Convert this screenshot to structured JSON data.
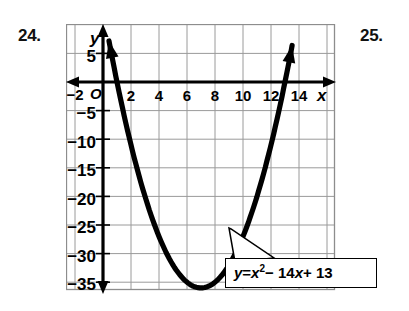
{
  "exercises": {
    "left_number": "24.",
    "right_number": "25."
  },
  "figure": {
    "callout_equation_plain": "y = x2 - 14x + 13",
    "callout_parts": {
      "y": "y",
      "equals": "=",
      "x": "x",
      "exponent": "2",
      "minus": "− 14",
      "x2": "x",
      "plus": "+ 13"
    },
    "x_axis_label": "x",
    "y_axis_label": "y",
    "origin_label": "O"
  },
  "chart_data": {
    "type": "line",
    "title": "",
    "subtitle": "",
    "xlabel": "x",
    "ylabel": "y",
    "equation": "y = x^2 - 14x + 13",
    "curve_kind": "parabola",
    "vertex": [
      7,
      -36
    ],
    "x_intercepts": [
      1,
      13
    ],
    "y_intercept": 13,
    "xlim": [
      -3,
      16
    ],
    "ylim": [
      -38,
      8
    ],
    "grid": true,
    "grid_step_x": 2,
    "grid_step_y": 5,
    "legend": "none",
    "annotations": [
      {
        "text": "y = x² − 14x + 13",
        "points_to": [
          11.5,
          -27
        ]
      }
    ],
    "xticks": [
      -2,
      2,
      4,
      6,
      8,
      10,
      12,
      14
    ],
    "xtick_labels": [
      "−2",
      "2",
      "4",
      "6",
      "8",
      "10",
      "12",
      "14"
    ],
    "yticks": [
      5,
      -5,
      -10,
      -15,
      -20,
      -25,
      -30,
      -35
    ],
    "ytick_labels": [
      "5",
      "−5",
      "−10",
      "−15",
      "−20",
      "−25",
      "−30",
      "−35"
    ],
    "series": [
      {
        "name": "y = x^2 - 14x + 13",
        "x": [
          -1.2,
          -1.0,
          -0.5,
          0,
          0.5,
          1,
          1.5,
          2,
          2.5,
          3,
          3.5,
          4,
          4.5,
          5,
          5.5,
          6,
          6.5,
          7,
          7.5,
          8,
          8.5,
          9,
          9.5,
          10,
          10.5,
          11,
          11.5,
          12,
          12.5,
          13,
          13.5,
          14,
          14.5,
          15,
          15.2
        ],
        "y": [
          31.2,
          28,
          20.25,
          13,
          6.25,
          0,
          -5.75,
          -11,
          -15.75,
          -20,
          -23.75,
          -27,
          -29.75,
          -32,
          -33.75,
          -35,
          -35.75,
          -36,
          -35.75,
          -35,
          -33.75,
          -32,
          -29.75,
          -27,
          -23.75,
          -20,
          -15.75,
          -11,
          -5.75,
          0,
          6.25,
          13,
          20.25,
          28,
          31.2
        ]
      }
    ],
    "colors": {
      "curve": "#000000",
      "axis": "#000000",
      "grid": "#9a9a9a",
      "background": "#ffffff"
    }
  }
}
